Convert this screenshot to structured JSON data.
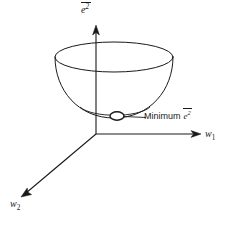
{
  "figure": {
    "background_color": "#ffffff",
    "line_color": "#1a1a1a",
    "axes": {
      "vertical": {
        "name": "vertical-axis",
        "label_base": "e",
        "label_exponent": "2",
        "label_overline": true,
        "label_text": "ē²",
        "direction": "up",
        "origin": [
          96,
          134
        ],
        "tip": [
          96,
          26
        ]
      },
      "horizontal": {
        "name": "w1-axis",
        "label_base": "w",
        "label_subscript": "1",
        "label_text": "w₁",
        "direction": "right",
        "origin": [
          96,
          134
        ],
        "tip": [
          200,
          134
        ]
      },
      "depth": {
        "name": "w2-axis",
        "label_base": "w",
        "label_subscript": "2",
        "label_text": "w₂",
        "direction": "down-left",
        "origin": [
          96,
          134
        ],
        "tip": [
          22,
          196
        ]
      }
    },
    "surface": {
      "name": "paraboloid-bowl",
      "rim_ellipse": {
        "cx": 114,
        "cy": 57,
        "rx": 59,
        "ry": 15
      },
      "bottom_y": 118,
      "fill": "none"
    },
    "minimum_marker": {
      "name": "minimum-point-marker",
      "cx": 117,
      "cy": 116,
      "rx": 7,
      "ry": 4.2
    },
    "annotation": {
      "name": "minimum-annotation",
      "text": "Minimum",
      "symbol_base": "e",
      "symbol_exponent": "2",
      "symbol_overline": true,
      "full_text": "Minimum ē²",
      "leader_from": [
        124,
        116
      ],
      "leader_to": [
        146,
        117
      ]
    }
  }
}
